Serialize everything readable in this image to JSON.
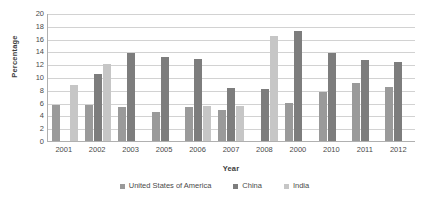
{
  "chart_data": {
    "type": "bar",
    "title": "",
    "subtitle": "",
    "xlabel": "Year",
    "ylabel": "Percentage",
    "categories": [
      "2001",
      "2002",
      "2003",
      "2005",
      "2006",
      "2007",
      "2008",
      "2000",
      "2010",
      "2011",
      "2012"
    ],
    "series": [
      {
        "name": "United States of America",
        "color": "#9a9a9a",
        "values": [
          5.7,
          5.6,
          5.3,
          4.6,
          5.3,
          4.9,
          null,
          5.9,
          7.6,
          9.0,
          8.5
        ]
      },
      {
        "name": "China",
        "color": "#7d7d7d",
        "values": [
          null,
          10.5,
          13.8,
          13.1,
          12.8,
          8.3,
          8.2,
          17.2,
          13.8,
          12.6,
          12.4
        ]
      },
      {
        "name": "India",
        "color": "#c6c6c6",
        "values": [
          8.7,
          12.0,
          null,
          null,
          5.5,
          5.4,
          16.4,
          null,
          null,
          null,
          null
        ]
      }
    ],
    "ylim": [
      0,
      20
    ],
    "yticks": [
      0,
      2,
      4,
      6,
      8,
      10,
      12,
      14,
      16,
      18,
      20
    ],
    "grid": true,
    "grid_axis": "y",
    "legend_position": "bottom",
    "background_color": "#ffffff",
    "gridline_color": "#d2d2d2",
    "axis_color": "#b0b0b0",
    "text_color": "#4a4a4a"
  }
}
